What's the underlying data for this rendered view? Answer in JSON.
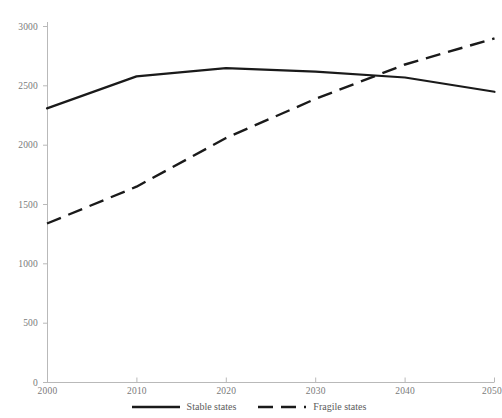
{
  "chart_data": {
    "type": "line",
    "title": "",
    "xlabel": "",
    "ylabel": "",
    "x": [
      2000,
      2010,
      2020,
      2030,
      2040,
      2050
    ],
    "xlim": [
      2000,
      2050
    ],
    "ylim": [
      0,
      3000
    ],
    "grid": false,
    "legend_position": "bottom-center",
    "xticks": [
      "2000",
      "2010",
      "2020",
      "2030",
      "2040",
      "2050"
    ],
    "yticks": [
      "0",
      "500",
      "1000",
      "1500",
      "2000",
      "2500",
      "3000"
    ],
    "series": [
      {
        "name": "Stable states",
        "style": "solid",
        "color": "#1a1a1a",
        "values": [
          2310,
          2580,
          2650,
          2620,
          2570,
          2450
        ]
      },
      {
        "name": "Fragile states",
        "style": "dashed",
        "color": "#1a1a1a",
        "values": [
          1340,
          1650,
          2060,
          2390,
          2680,
          2900
        ]
      }
    ],
    "annotations": [
      {
        "label": "series-crossover",
        "x": 2037,
        "y": 2600
      }
    ]
  },
  "axes": {
    "y_ticks": [
      {
        "label": "3000",
        "value": 3000
      },
      {
        "label": "2500",
        "value": 2500
      },
      {
        "label": "2000",
        "value": 2000
      },
      {
        "label": "1500",
        "value": 1500
      },
      {
        "label": "1000",
        "value": 1000
      },
      {
        "label": "500",
        "value": 500
      },
      {
        "label": "0",
        "value": 0
      }
    ],
    "x_ticks": [
      {
        "label": "2000",
        "value": 2000
      },
      {
        "label": "2010",
        "value": 2010
      },
      {
        "label": "2020",
        "value": 2020
      },
      {
        "label": "2030",
        "value": 2030
      },
      {
        "label": "2040",
        "value": 2040
      },
      {
        "label": "2050",
        "value": 2050
      }
    ],
    "axis_color": "#b8b8b8"
  },
  "legend": {
    "items": [
      {
        "label": "Stable states",
        "style": "solid"
      },
      {
        "label": "Fragile states",
        "style": "dashed"
      }
    ]
  }
}
